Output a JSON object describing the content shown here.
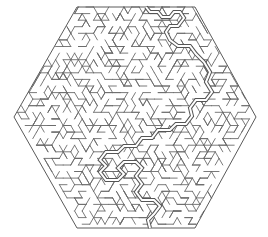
{
  "title": "Hexagonal maze with solution",
  "canvas": {
    "width": 268,
    "height": 237,
    "background": "#ffffff"
  },
  "colors": {
    "wall": "#6b6b6b",
    "outline": "#5a5a5a",
    "solution_outer": "#555555",
    "solution_inner": "#ffffff"
  },
  "hexagon": {
    "points": [
      [
        77,
        7
      ],
      [
        195,
        7
      ],
      [
        256,
        117
      ],
      [
        195,
        228
      ],
      [
        77,
        228
      ],
      [
        14,
        117
      ]
    ]
  },
  "grid": {
    "cell": 7.6,
    "seed": 1337
  },
  "solution": {
    "entry_label": "start",
    "exit_label": "end",
    "points": [
      [
        146,
        7
      ],
      [
        150,
        12
      ],
      [
        158,
        12
      ],
      [
        162,
        17
      ],
      [
        170,
        17
      ],
      [
        174,
        12
      ],
      [
        180,
        12
      ],
      [
        184,
        18
      ],
      [
        178,
        26
      ],
      [
        170,
        26
      ],
      [
        166,
        32
      ],
      [
        170,
        40
      ],
      [
        178,
        46
      ],
      [
        190,
        46
      ],
      [
        196,
        54
      ],
      [
        204,
        62
      ],
      [
        210,
        72
      ],
      [
        206,
        82
      ],
      [
        212,
        92
      ],
      [
        206,
        100
      ],
      [
        196,
        100
      ],
      [
        190,
        108
      ],
      [
        192,
        116
      ],
      [
        186,
        124
      ],
      [
        176,
        124
      ],
      [
        170,
        130
      ],
      [
        158,
        130
      ],
      [
        152,
        138
      ],
      [
        142,
        138
      ],
      [
        136,
        146
      ],
      [
        124,
        146
      ],
      [
        118,
        152
      ],
      [
        106,
        152
      ],
      [
        100,
        160
      ],
      [
        106,
        166
      ],
      [
        100,
        172
      ],
      [
        106,
        180
      ],
      [
        118,
        180
      ],
      [
        124,
        174
      ],
      [
        118,
        168
      ],
      [
        124,
        162
      ],
      [
        136,
        162
      ],
      [
        142,
        168
      ],
      [
        136,
        176
      ],
      [
        142,
        184
      ],
      [
        136,
        192
      ],
      [
        142,
        200
      ],
      [
        154,
        200
      ],
      [
        160,
        206
      ],
      [
        154,
        214
      ],
      [
        148,
        220
      ],
      [
        150,
        228
      ]
    ]
  }
}
